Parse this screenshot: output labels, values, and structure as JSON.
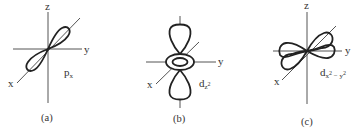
{
  "figure": {
    "panels": [
      {
        "id": "a",
        "caption": "(a)",
        "orbital": {
          "main": "p",
          "sub": "x"
        },
        "axes": {
          "z": "z",
          "y": "y",
          "x": "x"
        },
        "shape": "dumbbell along x-axis (two lobes)"
      },
      {
        "id": "b",
        "caption": "(b)",
        "orbital": {
          "main": "d",
          "sub": "z",
          "sub_sup": "2"
        },
        "axes": {
          "z": "",
          "y": "y",
          "x": "x"
        },
        "shape": "two lobes along z-axis with torus in xy-plane"
      },
      {
        "id": "c",
        "caption": "(c)",
        "orbital": {
          "main": "d",
          "sub": "x",
          "sub_sup": "2",
          "sub2": " − y",
          "sub2_sup": "2"
        },
        "axes": {
          "z": "z",
          "y": "y",
          "x": "x"
        },
        "shape": "four lobes along x and y axes"
      }
    ]
  }
}
